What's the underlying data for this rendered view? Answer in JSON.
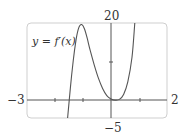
{
  "chart_data": {
    "type": "line",
    "title": "",
    "xlabel": "",
    "ylabel": "",
    "xlim": [
      -3,
      2
    ],
    "ylim": [
      -5,
      20
    ],
    "grid": false,
    "tick_labels": {
      "x_min": "−3",
      "x_max": "2",
      "y_max": "20",
      "y_min": "−5"
    },
    "x_ticks": [
      -2,
      -1,
      0,
      1
    ],
    "y_ticks": [
      10
    ],
    "series": [
      {
        "name": "y = f'(x)",
        "x": [
          -1.55,
          -1.45,
          -1.35,
          -1.25,
          -1.15,
          -1.05,
          -0.95,
          -0.85,
          -0.75,
          -0.6,
          -0.45,
          -0.3,
          -0.15,
          0,
          0.15,
          0.3,
          0.45,
          0.6,
          0.75,
          0.85
        ],
        "y": [
          -5,
          3,
          10,
          15.5,
          18.8,
          19.6,
          18.5,
          16,
          13,
          9,
          5.5,
          2.8,
          0.9,
          0,
          -0.3,
          -0.1,
          1.2,
          4.5,
          11,
          20
        ]
      }
    ],
    "annotations": [
      {
        "text": "y = f'(x)",
        "x": -2.9,
        "y": 15
      }
    ]
  },
  "labels": {
    "function_label": "y = f′(x)",
    "x_min": "−3",
    "x_max": "2",
    "y_max": "20",
    "y_min": "−5"
  }
}
